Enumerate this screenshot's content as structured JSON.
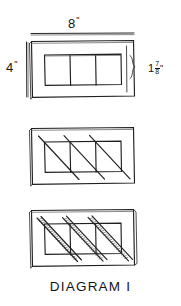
{
  "caption": "DIAGRAM I",
  "dimensions": {
    "width_label": "8",
    "width_unit": "\"",
    "height_label": "4",
    "height_unit": "\"",
    "slot_whole": "1",
    "slot_numerator": "7",
    "slot_denominator": "8",
    "slot_unit": "\""
  },
  "colors": {
    "ink": "#1a1a1a",
    "paper": "#ffffff",
    "shadow": "#6a6a6a"
  },
  "figures": [
    {
      "name": "figure-plain-panel",
      "description": "Rectangular panel with three rectangular slots, overall 8 inches by 4 inches, each slot 1 7/8 inches",
      "slot_count": 3,
      "diagonals": "none"
    },
    {
      "name": "figure-single-diagonals",
      "description": "Same panel with one diagonal line drawn through each of the three slots",
      "slot_count": 3,
      "diagonals": "single"
    },
    {
      "name": "figure-double-diagonals",
      "description": "Same panel with paired hatched diagonal bands through each of the three slots",
      "slot_count": 3,
      "diagonals": "double-hatched"
    }
  ]
}
